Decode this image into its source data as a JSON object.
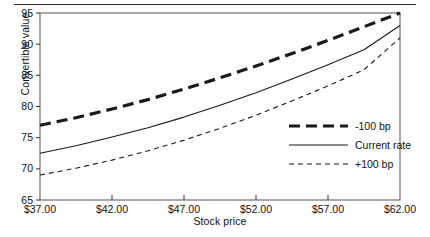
{
  "chart_data": {
    "type": "line",
    "title": "",
    "xlabel": "Stock price",
    "ylabel": "Convertible value",
    "xlim": [
      37,
      62
    ],
    "ylim": [
      65,
      95
    ],
    "grid": false,
    "legend_position": "inside-right-middle",
    "xticks": [
      37,
      42,
      47,
      52,
      57,
      62
    ],
    "xticklabels": [
      "$37.00",
      "$42.00",
      "$47.00",
      "$52.00",
      "$57.00",
      "$62.00"
    ],
    "yticks": [
      65,
      70,
      75,
      80,
      85,
      90,
      95
    ],
    "yticklabels": [
      "65",
      "70",
      "75",
      "80",
      "85",
      "90",
      "95"
    ],
    "x": [
      37,
      39.5,
      42,
      44.5,
      47,
      49.5,
      52,
      54.5,
      57,
      59.5,
      62
    ],
    "series": [
      {
        "name": "-100 bp",
        "style": "thick-dashed",
        "values": [
          77.0,
          78.2,
          79.6,
          81.1,
          82.8,
          84.6,
          86.5,
          88.5,
          90.6,
          92.8,
          95.0
        ]
      },
      {
        "name": "Current rate",
        "style": "solid",
        "values": [
          72.5,
          73.7,
          75.1,
          76.6,
          78.3,
          80.2,
          82.2,
          84.4,
          86.7,
          89.1,
          93.0
        ]
      },
      {
        "name": "+100 bp",
        "style": "thin-dashed",
        "values": [
          69.0,
          70.1,
          71.4,
          72.9,
          74.6,
          76.5,
          78.6,
          80.9,
          83.3,
          85.9,
          91.0
        ]
      }
    ]
  },
  "legend": {
    "items": [
      {
        "label": "-100 bp",
        "style": "thick-dashed"
      },
      {
        "label": "Current rate",
        "style": "solid"
      },
      {
        "label": "+100 bp",
        "style": "thin-dashed"
      }
    ]
  },
  "axis_labels": {
    "x": "Stock price",
    "y": "Convertible value"
  }
}
